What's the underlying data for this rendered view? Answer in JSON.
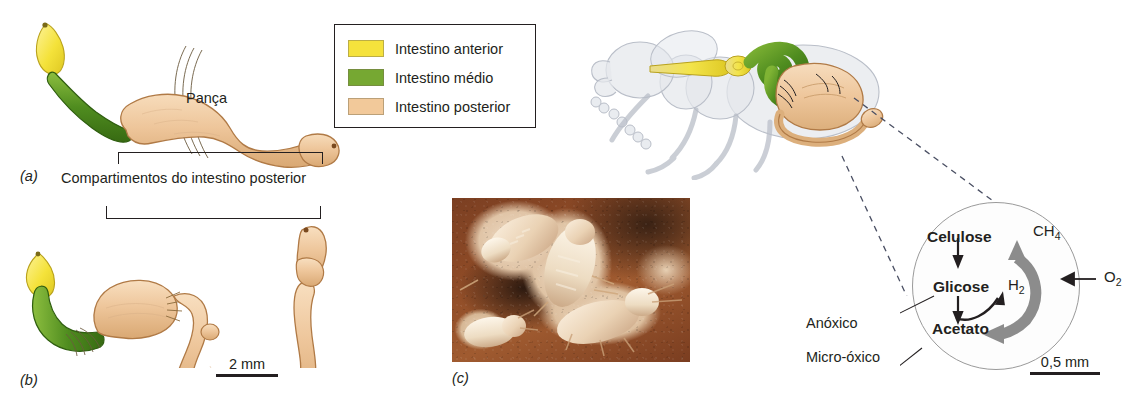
{
  "figure": {
    "panels": [
      {
        "letter": "(a)"
      },
      {
        "letter": "(b)"
      },
      {
        "letter": "(c)"
      }
    ]
  },
  "legend": {
    "items": [
      {
        "label": "Intestino anterior",
        "color": "#f5e23c",
        "name": "foregut"
      },
      {
        "label": "Intestino médio",
        "color": "#76a832",
        "name": "midgut"
      },
      {
        "label": "Intestino posterior",
        "color": "#f2c99a",
        "name": "hindgut"
      }
    ]
  },
  "annotations": {
    "paunch": "Pança",
    "hindgut_compartments": "Compartimentos do intestino posterior",
    "anoxic": "Anóxico",
    "microoxic": "Micro-óxico"
  },
  "scale_bars": {
    "gut": "2 mm",
    "circle": "0,5 mm"
  },
  "metabolism": {
    "cellulose": "Celulose",
    "glucose": "Glicose",
    "acetate": "Acetato",
    "hydrogen": "H",
    "hydrogen_sub": "2",
    "methane": "CH",
    "methane_sub": "4",
    "oxygen": "O",
    "oxygen_sub": "2"
  },
  "colors": {
    "foregut": "#f5e23c",
    "midgut": "#76a832",
    "hindgut": "#f2c99a",
    "hindgut_outline": "#b07a46",
    "body_outline": "#c8ccd4",
    "ink": "#231f20",
    "gray_arrow": "#8c8c8c"
  }
}
